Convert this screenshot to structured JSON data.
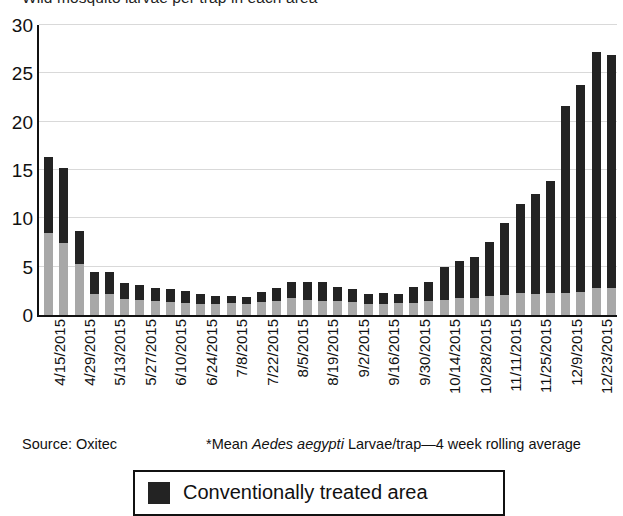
{
  "chart_data": {
    "type": "bar",
    "title": "Wild mosquito larvae per trap in each area",
    "xlabel": "",
    "ylabel": "",
    "ylim": [
      0,
      30
    ],
    "yticks": [
      0,
      5,
      10,
      15,
      20,
      25,
      30
    ],
    "grid": true,
    "stacked": true,
    "legend_position": "bottom",
    "source": "Source: Oxitec",
    "footnote": "*Mean Aedes aegypti Larvae/trap—4 week rolling average",
    "footnote_prefix": "*Mean ",
    "footnote_italic": "Aedes aegypti",
    "footnote_suffix": " Larvae/trap—4 week rolling average",
    "categories": [
      "4/15/2015",
      "4/22/2015",
      "4/29/2015",
      "5/6/2015",
      "5/13/2015",
      "5/20/2015",
      "5/27/2015",
      "6/3/2015",
      "6/10/2015",
      "6/17/2015",
      "6/24/2015",
      "7/1/2015",
      "7/8/2015",
      "7/15/2015",
      "7/22/2015",
      "7/29/2015",
      "8/5/2015",
      "8/12/2015",
      "8/19/2015",
      "8/26/2015",
      "9/2/2015",
      "9/9/2015",
      "9/16/2015",
      "9/23/2015",
      "9/30/2015",
      "10/7/2015",
      "10/14/2015",
      "10/21/2015",
      "10/28/2015",
      "11/4/2015",
      "11/11/2015",
      "11/18/2015",
      "11/25/2015",
      "12/2/2015",
      "12/9/2015",
      "12/16/2015",
      "12/23/2015",
      "12/30/2015"
    ],
    "xtick_labels": [
      "4/15/2015",
      "4/29/2015",
      "5/13/2015",
      "5/27/2015",
      "6/10/2015",
      "6/24/2015",
      "7/8/2015",
      "7/22/2015",
      "8/5/2015",
      "8/19/2015",
      "9/2/2015",
      "9/16/2015",
      "9/30/2015",
      "10/14/2015",
      "10/28/2015",
      "11/11/2015",
      "11/25/2015",
      "12/9/2015",
      "12/23/2015"
    ],
    "xtick_indices": [
      0,
      2,
      4,
      6,
      8,
      10,
      12,
      14,
      16,
      18,
      20,
      22,
      24,
      26,
      28,
      30,
      32,
      34,
      36
    ],
    "series": [
      {
        "name": "Conventionally treated area",
        "color": "#232323",
        "values": [
          7.8,
          7.7,
          3.4,
          2.3,
          2.3,
          1.6,
          1.5,
          1.4,
          1.4,
          1.3,
          1.1,
          0.9,
          0.8,
          0.8,
          1.1,
          1.3,
          1.6,
          1.8,
          2.0,
          1.5,
          1.4,
          1.1,
          1.2,
          1.0,
          1.7,
          2.0,
          3.4,
          3.8,
          4.2,
          5.6,
          7.4,
          9.2,
          10.3,
          11.6,
          19.3,
          21.4,
          24.4,
          24.1
        ]
      },
      {
        "name": "Mosquito control area",
        "color": "#a8a8a8",
        "values": [
          8.5,
          7.5,
          5.3,
          2.2,
          2.2,
          1.7,
          1.6,
          1.4,
          1.3,
          1.2,
          1.1,
          1.1,
          1.2,
          1.1,
          1.3,
          1.5,
          1.8,
          1.6,
          1.4,
          1.4,
          1.3,
          1.1,
          1.1,
          1.2,
          1.2,
          1.4,
          1.6,
          1.8,
          1.8,
          2.0,
          2.1,
          2.3,
          2.2,
          2.3,
          2.3,
          2.4,
          2.8,
          2.8
        ]
      }
    ],
    "totals": [
      16.3,
      15.2,
      8.7,
      4.5,
      4.5,
      3.3,
      3.1,
      2.8,
      2.7,
      2.5,
      2.2,
      2.0,
      2.0,
      1.9,
      2.4,
      2.8,
      3.4,
      3.4,
      3.4,
      2.9,
      2.7,
      2.2,
      2.3,
      2.2,
      2.9,
      3.4,
      5.0,
      5.6,
      6.0,
      7.6,
      9.5,
      11.5,
      12.5,
      13.9,
      21.6,
      23.8,
      27.2,
      26.9
    ]
  },
  "legend": {
    "entries": [
      {
        "label": "Conventionally treated area",
        "color": "#232323"
      }
    ]
  }
}
